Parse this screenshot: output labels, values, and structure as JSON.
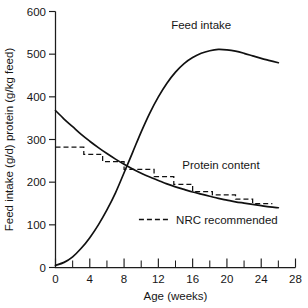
{
  "chart_data": {
    "type": "line",
    "title": "",
    "subtitle": "",
    "xlabel": "Age (weeks)",
    "ylabel": "Feed intake (g/d) protein (g/kg feed)",
    "xlim": [
      0,
      28
    ],
    "ylim": [
      0,
      600
    ],
    "grid": false,
    "legend_position": "inside-bottom-right",
    "x_ticks": [
      "0",
      "4",
      "8",
      "12",
      "16",
      "20",
      "24",
      "28"
    ],
    "x_tick_values": [
      0,
      4,
      8,
      12,
      16,
      20,
      24,
      28
    ],
    "x_minor_tick_values": [
      2,
      6,
      10,
      14,
      18,
      22,
      26
    ],
    "y_ticks": [
      "0",
      "100",
      "200",
      "300",
      "400",
      "500",
      "600"
    ],
    "y_tick_values": [
      0,
      100,
      200,
      300,
      400,
      500,
      600
    ],
    "series": [
      {
        "name": "Feed intake",
        "style": "solid",
        "x": [
          0,
          1,
          2,
          3,
          4,
          5,
          6,
          7,
          8,
          9,
          10,
          11,
          12,
          13,
          14,
          15,
          16,
          17,
          18,
          19,
          20,
          21,
          22,
          23,
          24,
          25,
          26
        ],
        "values": [
          5,
          12,
          25,
          45,
          70,
          100,
          135,
          175,
          222,
          270,
          318,
          362,
          400,
          432,
          458,
          478,
          492,
          502,
          508,
          511,
          510,
          507,
          502,
          496,
          490,
          485,
          480
        ]
      },
      {
        "name": "Protein content",
        "style": "solid",
        "x": [
          0,
          1,
          2,
          3,
          4,
          5,
          6,
          7,
          8,
          9,
          10,
          11,
          12,
          13,
          14,
          15,
          16,
          17,
          18,
          19,
          20,
          21,
          22,
          23,
          24,
          25,
          26
        ],
        "values": [
          368,
          348,
          330,
          312,
          296,
          281,
          267,
          254,
          242,
          231,
          221,
          212,
          204,
          196,
          189,
          183,
          177,
          172,
          167,
          162,
          158,
          154,
          151,
          148,
          145,
          142,
          140
        ]
      },
      {
        "name": "NRC recommended",
        "style": "dashed-step",
        "x_edges": [
          0,
          3.3,
          5.5,
          8.0,
          11.5,
          13.8,
          16.0,
          18.3,
          21.0,
          23.0,
          25.3
        ],
        "values": [
          282,
          265,
          248,
          230,
          213,
          195,
          178,
          170,
          160,
          150
        ]
      }
    ],
    "annotations": [
      {
        "text": "Feed intake",
        "x": 17.0,
        "y": 560
      },
      {
        "text": "Protein content",
        "x": 19.3,
        "y": 232
      },
      {
        "text": "NRC recommended",
        "x": 20.0,
        "y": 103
      }
    ],
    "legend": [
      {
        "label": "NRC recommended",
        "style": "dashed"
      }
    ],
    "colors": {
      "axis": "#1c1c1c",
      "curve": "#111111",
      "text": "#161616",
      "background": "#ffffff"
    }
  }
}
